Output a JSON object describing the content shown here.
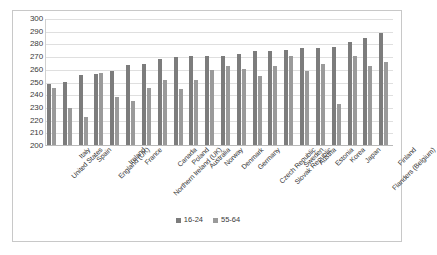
{
  "chart_data": {
    "type": "bar",
    "title": "",
    "subtitle": "",
    "xlabel": "",
    "ylabel": "",
    "ylim": [
      200,
      300
    ],
    "ytick_step": 10,
    "yticks": [
      "300",
      "290",
      "280",
      "270",
      "260",
      "250",
      "240",
      "230",
      "220",
      "210",
      "200"
    ],
    "grid": true,
    "legend_position": "bottom-center",
    "categories": [
      "United States",
      "Italy",
      "Spain",
      "England (UK)",
      "Ireland",
      "France",
      "Northern Ireland (UK)",
      "Canada",
      "Poland",
      "Australia",
      "Norway",
      "Denmark",
      "Germany",
      "Czech Republic",
      "Slovak Republic",
      "Sweden",
      "Austria",
      "Estonia",
      "Korea",
      "Japan",
      "Flanders (Belgium)",
      "Finland"
    ],
    "series": [
      {
        "name": "16-24",
        "color": "#7c7c7c",
        "values": [
          248,
          250,
          255,
          256,
          258,
          263,
          264,
          268,
          269,
          270,
          270,
          270,
          272,
          274,
          274,
          275,
          276,
          276,
          277,
          281,
          284,
          288
        ]
      },
      {
        "name": "55-64",
        "color": "#9a9a9a",
        "values": [
          245,
          229,
          222,
          257,
          238,
          235,
          245,
          251,
          244,
          251,
          259,
          262,
          260,
          254,
          262,
          270,
          258,
          264,
          232,
          270,
          262,
          265
        ]
      }
    ]
  },
  "legend": {
    "entries": [
      {
        "label": "16-24",
        "color": "#7c7c7c"
      },
      {
        "label": "55-64",
        "color": "#9a9a9a"
      }
    ]
  }
}
